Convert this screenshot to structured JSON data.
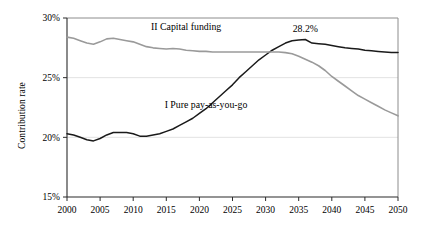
{
  "chart_data": {
    "type": "line",
    "title": "",
    "subtitle": "",
    "xlabel": "",
    "ylabel": "Contribution rate",
    "xlim": [
      2000,
      2050
    ],
    "ylim": [
      15,
      30
    ],
    "grid": true,
    "legend_position": "inline-annotations",
    "x_ticks": [
      "2000",
      "2005",
      "2010",
      "2015",
      "2020",
      "2025",
      "2030",
      "2035",
      "2040",
      "2045",
      "2050"
    ],
    "y_ticks": [
      "15%",
      "20%",
      "25%",
      "30%"
    ],
    "annotations": [
      {
        "text": "28.2%",
        "x": 2036,
        "y": 28.2
      }
    ],
    "series": [
      {
        "name": "I Pure pay-as-you-go",
        "label": "I Pure pay-as-you-go",
        "color": "#1a1a1a",
        "x": [
          2000,
          2001,
          2002,
          2003,
          2004,
          2005,
          2006,
          2007,
          2008,
          2009,
          2010,
          2011,
          2012,
          2013,
          2014,
          2015,
          2016,
          2017,
          2018,
          2019,
          2020,
          2021,
          2022,
          2023,
          2024,
          2025,
          2026,
          2027,
          2028,
          2029,
          2030,
          2031,
          2032,
          2033,
          2034,
          2035,
          2036,
          2037,
          2038,
          2039,
          2040,
          2041,
          2042,
          2043,
          2044,
          2045,
          2046,
          2047,
          2048,
          2049,
          2050
        ],
        "values": [
          20.3,
          20.2,
          20.0,
          19.8,
          19.7,
          19.9,
          20.2,
          20.4,
          20.4,
          20.4,
          20.3,
          20.1,
          20.1,
          20.2,
          20.3,
          20.5,
          20.7,
          21.0,
          21.3,
          21.6,
          22.0,
          22.4,
          22.9,
          23.4,
          23.9,
          24.4,
          25.0,
          25.5,
          26.0,
          26.5,
          26.9,
          27.3,
          27.6,
          27.9,
          28.1,
          28.15,
          28.2,
          27.9,
          27.85,
          27.8,
          27.7,
          27.6,
          27.5,
          27.45,
          27.4,
          27.3,
          27.25,
          27.2,
          27.15,
          27.1,
          27.1
        ],
        "label_position": {
          "x": 2021,
          "y": 22.5
        }
      },
      {
        "name": "II Capital funding",
        "label": "II Capital funding",
        "color": "#9a9a9a",
        "x": [
          2000,
          2001,
          2002,
          2003,
          2004,
          2005,
          2006,
          2007,
          2008,
          2009,
          2010,
          2011,
          2012,
          2013,
          2014,
          2015,
          2016,
          2017,
          2018,
          2019,
          2020,
          2021,
          2022,
          2023,
          2024,
          2025,
          2026,
          2027,
          2028,
          2029,
          2030,
          2031,
          2032,
          2033,
          2034,
          2035,
          2036,
          2037,
          2038,
          2039,
          2040,
          2041,
          2042,
          2043,
          2044,
          2045,
          2046,
          2047,
          2048,
          2049,
          2050
        ],
        "values": [
          28.4,
          28.3,
          28.1,
          27.9,
          27.8,
          28.0,
          28.25,
          28.3,
          28.2,
          28.1,
          28.0,
          27.8,
          27.6,
          27.5,
          27.45,
          27.4,
          27.45,
          27.4,
          27.3,
          27.25,
          27.2,
          27.2,
          27.15,
          27.15,
          27.15,
          27.15,
          27.15,
          27.15,
          27.15,
          27.15,
          27.15,
          27.15,
          27.15,
          27.1,
          27.0,
          26.8,
          26.55,
          26.3,
          26.0,
          25.6,
          25.1,
          24.7,
          24.3,
          23.9,
          23.5,
          23.2,
          22.9,
          22.6,
          22.3,
          22.05,
          21.8
        ],
        "label_position": {
          "x": 2018,
          "y": 29.0
        }
      }
    ]
  },
  "axis": {
    "y_title": "Contribution rate"
  }
}
